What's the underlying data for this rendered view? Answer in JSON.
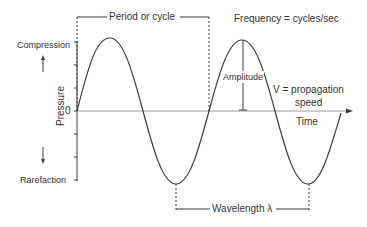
{
  "diagram": {
    "colors": {
      "line": "#3a3a3a",
      "text": "#333333",
      "background": "#ffffff"
    },
    "labels": {
      "period": "Period or cycle",
      "frequency": "Frequency = cycles/sec",
      "compression": "Compression",
      "rarefaction": "Rarefaction",
      "pressure_axis": "Pressure",
      "zero": "0",
      "amplitude": "Amplitude",
      "velocity_line1": "V = propagation",
      "velocity_line2": "speed",
      "time_axis": "Time",
      "wavelength": "Wavelength λ"
    },
    "icons": {
      "compression_arrow": "arrow-up-icon",
      "rarefaction_arrow": "arrow-down-icon",
      "time_arrow": "arrow-right-icon"
    }
  }
}
